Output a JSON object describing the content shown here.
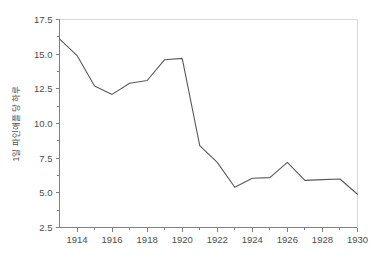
{
  "chart_data": {
    "type": "line",
    "title": "",
    "xlabel": "",
    "ylabel": "1일 파인애플 당 하루",
    "xlim": [
      1913,
      1930
    ],
    "ylim": [
      2.5,
      17.5
    ],
    "grid": false,
    "legend": null,
    "x": [
      1913,
      1914,
      1915,
      1916,
      1917,
      1918,
      1919,
      1920,
      1921,
      1922,
      1923,
      1924,
      1925,
      1926,
      1927,
      1928,
      1929,
      1930
    ],
    "values": [
      16.1,
      14.9,
      12.7,
      12.1,
      12.9,
      13.1,
      14.6,
      14.7,
      8.4,
      7.2,
      5.4,
      6.05,
      6.1,
      7.2,
      5.9,
      5.95,
      6.0,
      4.9
    ],
    "series": [
      {
        "name": "series-1",
        "color": "#595959",
        "values": [
          16.1,
          14.9,
          12.7,
          12.1,
          12.9,
          13.1,
          14.6,
          14.7,
          8.4,
          7.2,
          5.4,
          6.05,
          6.1,
          7.2,
          5.9,
          5.95,
          6.0,
          4.9
        ]
      }
    ],
    "y_ticks": [
      2.5,
      5.0,
      7.5,
      10.0,
      12.5,
      15.0,
      17.5
    ],
    "y_tick_labels": [
      "2.5",
      "5.0",
      "7.5",
      "10.0",
      "12.5",
      "15.0",
      "17.5"
    ],
    "y_minor_ticks": [
      3.75,
      6.25,
      8.75,
      11.25,
      13.75,
      16.25
    ],
    "x_ticks": [
      1914,
      1916,
      1918,
      1920,
      1922,
      1924,
      1926,
      1928,
      1930
    ],
    "x_tick_labels": [
      "1914",
      "1916",
      "1918",
      "1920",
      "1922",
      "1924",
      "1926",
      "1928",
      "1930"
    ],
    "x_minor_ticks": [
      1915,
      1917,
      1919,
      1921,
      1923,
      1925,
      1927,
      1929
    ]
  },
  "colors": {
    "line": "#595959",
    "spine_dark": "#808080",
    "spine_light": "#d9d9d9",
    "text": "#4d4d4d",
    "background": "#ffffff"
  }
}
